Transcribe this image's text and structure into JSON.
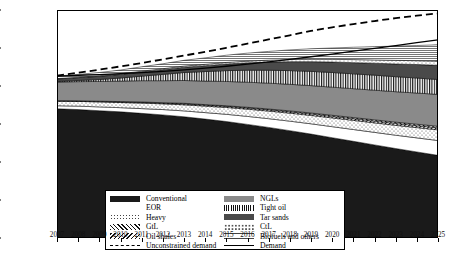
{
  "chart_data": {
    "type": "area",
    "title": "",
    "xlabel": "",
    "ylabel": "Production (million bbl/day)",
    "xlim": [
      2007,
      2025
    ],
    "ylim": [
      0,
      120
    ],
    "yticks": [
      0,
      20,
      40,
      60,
      80,
      100,
      120
    ],
    "x": [
      2007,
      2008,
      2009,
      2010,
      2011,
      2012,
      2013,
      2014,
      2015,
      2016,
      2017,
      2018,
      2019,
      2020,
      2021,
      2022,
      2023,
      2024,
      2025
    ],
    "xticklabels": [
      "2007",
      "2008",
      "2009",
      "2010",
      "2011",
      "2012",
      "2013",
      "2014",
      "2015",
      "2016",
      "2017",
      "2018",
      "2019",
      "2020",
      "2021",
      "2022",
      "2023",
      "2024",
      "2025"
    ],
    "grid": false,
    "legend_position": "lower-left-inside",
    "stacked": true,
    "series": [
      {
        "name": "Conventional",
        "fill": "solid-black",
        "color": "#1a1a1a",
        "values": [
          68.0,
          67.6,
          67.0,
          66.4,
          65.6,
          64.8,
          63.8,
          62.6,
          61.3,
          59.8,
          58.2,
          56.5,
          54.7,
          52.8,
          50.9,
          49.0,
          47.1,
          45.3,
          43.5
        ]
      },
      {
        "name": "EOR",
        "fill": "white",
        "color": "#ffffff",
        "values": [
          1.6,
          1.8,
          2.0,
          2.2,
          2.5,
          2.8,
          3.1,
          3.4,
          3.8,
          4.2,
          4.6,
          5.0,
          5.4,
          5.8,
          6.2,
          6.6,
          7.0,
          7.4,
          7.8
        ]
      },
      {
        "name": "Heavy",
        "fill": "dotted",
        "color": "#ffffff",
        "values": [
          2.4,
          2.5,
          2.6,
          2.7,
          2.9,
          3.0,
          3.2,
          3.4,
          3.6,
          3.8,
          4.0,
          4.2,
          4.4,
          4.6,
          4.8,
          5.0,
          5.2,
          5.4,
          5.6
        ]
      },
      {
        "name": "GtL",
        "fill": "diagonal-hatch",
        "color": "#ffffff",
        "values": [
          0.2,
          0.2,
          0.3,
          0.3,
          0.4,
          0.4,
          0.5,
          0.5,
          0.6,
          0.6,
          0.7,
          0.7,
          0.8,
          0.8,
          0.9,
          0.9,
          1.0,
          1.0,
          1.1
        ]
      },
      {
        "name": "Oil shales",
        "fill": "reverse-hatch",
        "color": "#ffffff",
        "values": [
          0.1,
          0.1,
          0.1,
          0.2,
          0.2,
          0.2,
          0.3,
          0.3,
          0.3,
          0.4,
          0.4,
          0.5,
          0.5,
          0.6,
          0.6,
          0.7,
          0.7,
          0.8,
          0.8
        ]
      },
      {
        "name": "NGLs",
        "fill": "solid-gray",
        "color": "#8a8a8a",
        "values": [
          9.8,
          10.1,
          10.4,
          10.8,
          11.2,
          11.6,
          12.0,
          12.4,
          12.8,
          13.2,
          13.6,
          14.0,
          14.4,
          14.8,
          15.2,
          15.6,
          16.0,
          16.4,
          16.8
        ]
      },
      {
        "name": "Tight oil",
        "fill": "vertical-hatch",
        "color": "#ffffff",
        "values": [
          0.3,
          0.6,
          1.0,
          1.6,
          2.4,
          3.3,
          4.2,
          5.0,
          5.7,
          6.3,
          6.8,
          7.2,
          7.5,
          7.7,
          7.8,
          7.9,
          7.9,
          7.9,
          7.8
        ]
      },
      {
        "name": "Tar sands",
        "fill": "solid-dark-gray",
        "color": "#4a4a4a",
        "values": [
          1.3,
          1.5,
          1.7,
          1.9,
          2.2,
          2.5,
          2.8,
          3.1,
          3.5,
          3.9,
          4.3,
          4.7,
          5.1,
          5.5,
          5.9,
          6.3,
          6.7,
          7.1,
          7.5
        ]
      },
      {
        "name": "CtL",
        "fill": "sparse-dots",
        "color": "#ffffff",
        "values": [
          0.2,
          0.2,
          0.3,
          0.3,
          0.4,
          0.5,
          0.6,
          0.7,
          0.8,
          0.9,
          1.0,
          1.1,
          1.3,
          1.4,
          1.6,
          1.7,
          1.9,
          2.0,
          2.2
        ]
      },
      {
        "name": "Biofuels and others",
        "fill": "fine-lines",
        "color": "#ffffff",
        "values": [
          1.3,
          1.5,
          1.7,
          2.0,
          2.3,
          2.6,
          3.0,
          3.4,
          3.8,
          4.2,
          4.6,
          5.1,
          5.5,
          6.0,
          6.5,
          7.0,
          7.5,
          8.0,
          8.6
        ]
      }
    ],
    "lines": [
      {
        "name": "Unconstrained demand",
        "style": "dashed",
        "color": "#000000",
        "values": [
          85.5,
          87.0,
          88.6,
          90.3,
          92.1,
          94.0,
          96.0,
          98.0,
          100.1,
          102.3,
          104.5,
          106.7,
          109.0,
          110.9,
          112.6,
          114.2,
          115.7,
          117.0,
          118.2
        ]
      },
      {
        "name": "Demand",
        "style": "solid",
        "color": "#000000",
        "values": [
          85.2,
          85.6,
          86.0,
          86.5,
          87.0,
          87.7,
          88.5,
          89.4,
          90.4,
          91.5,
          92.7,
          94.0,
          95.4,
          96.8,
          98.3,
          99.8,
          101.3,
          102.8,
          104.3
        ]
      }
    ]
  },
  "legend": {
    "rows": [
      {
        "left_label": "Conventional",
        "left_key": "conventional",
        "right_label": "NGLs",
        "right_key": "ngls"
      },
      {
        "left_label": "EOR",
        "left_key": "eor",
        "right_label": "Tight oil",
        "right_key": "tightoil"
      },
      {
        "left_label": "Heavy",
        "left_key": "heavy",
        "right_label": "Tar sands",
        "right_key": "tarsands"
      },
      {
        "left_label": "GtL",
        "left_key": "gtl",
        "right_label": "CtL",
        "right_key": "ctl"
      },
      {
        "left_label": "Oil shales",
        "left_key": "oilshales",
        "right_label": "Biofuels and others",
        "right_key": "biofuels"
      },
      {
        "left_label": "Unconstrained demand",
        "left_key": "line-dashed",
        "right_label": "Demand",
        "right_key": "line-solid"
      }
    ]
  }
}
